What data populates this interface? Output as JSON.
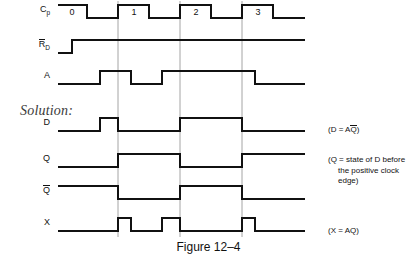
{
  "figure": {
    "caption": "Figure 12–4",
    "solution_label": "Solution:"
  },
  "signals": [
    {
      "name": "Cp",
      "label_main": "C",
      "label_sub": "p",
      "overbar": false,
      "row_y": 18
    },
    {
      "name": "RD",
      "label_main": "R",
      "label_sub": "D",
      "overbar": true,
      "row_y": 53
    },
    {
      "name": "A",
      "label_main": "A",
      "label_sub": "",
      "overbar": false,
      "row_y": 84
    },
    {
      "name": "D",
      "label_main": "D",
      "label_sub": "",
      "overbar": false,
      "row_y": 131
    },
    {
      "name": "Q",
      "label_main": "Q",
      "label_sub": "",
      "overbar": false,
      "row_y": 167
    },
    {
      "name": "Qbar",
      "label_main": "Q",
      "label_sub": "",
      "overbar": true,
      "row_y": 199
    },
    {
      "name": "X",
      "label_main": "X",
      "label_sub": "",
      "overbar": false,
      "row_y": 231
    }
  ],
  "clock_pulse_labels": [
    "0",
    "1",
    "2",
    "3"
  ],
  "annotations": [
    {
      "id": "d-annot",
      "text_pre": "(D = A",
      "overbar_char": "Q",
      "text_post": ")",
      "x": 328,
      "y": 126
    },
    {
      "id": "q-annot-line1",
      "text": "(Q = state of D before",
      "x": 328,
      "y": 158
    },
    {
      "id": "q-annot-line2",
      "text": "the positive clock",
      "x": 328,
      "y": 158
    },
    {
      "id": "q-annot-line3",
      "text": "edge)",
      "x": 328,
      "y": 158
    },
    {
      "id": "x-annot",
      "text": "(X = AQ)",
      "x": 328,
      "y": 227
    }
  ],
  "annotation_text": {
    "d_pre": "(D = A",
    "d_q": "Q",
    "d_post": ")",
    "q_line1": "(Q = state of D before",
    "q_line2": "the positive clock",
    "q_line3": "edge)",
    "x_full": "(X = AQ)"
  },
  "colors": {
    "waveform": "#111111",
    "gridline": "#8d8d8d",
    "text": "#111111",
    "solution_text": "#3a3a3a",
    "background": "#ffffff"
  },
  "chart_data": {
    "type": "line",
    "title": "Figure 12–4",
    "xlabel": "",
    "ylabel": "",
    "grid": true,
    "legend_position": "right",
    "time_axis": {
      "x_start": 58,
      "x_end": 305,
      "units": "pixels",
      "clock_period": 62,
      "clock_high_width": 31
    },
    "gridlines_x": [
      118,
      180,
      242
    ],
    "gridline_note": "positive clock edges of pulses 1, 2, 3",
    "series": [
      {
        "name": "Cp",
        "description": "Clock, 4 positive pulses labelled 0,1,2,3",
        "levels": [
          {
            "x": 58,
            "v": 1
          },
          {
            "x": 87,
            "v": 1
          },
          {
            "x": 87,
            "v": 0
          },
          {
            "x": 118,
            "v": 0
          },
          {
            "x": 118,
            "v": 1
          },
          {
            "x": 149,
            "v": 1
          },
          {
            "x": 149,
            "v": 0
          },
          {
            "x": 180,
            "v": 0
          },
          {
            "x": 180,
            "v": 1
          },
          {
            "x": 211,
            "v": 1
          },
          {
            "x": 211,
            "v": 0
          },
          {
            "x": 242,
            "v": 0
          },
          {
            "x": 242,
            "v": 1
          },
          {
            "x": 273,
            "v": 1
          },
          {
            "x": 273,
            "v": 0
          },
          {
            "x": 305,
            "v": 0
          }
        ],
        "pulse_labels": [
          {
            "label": "0",
            "x": 72
          },
          {
            "label": "1",
            "x": 134
          },
          {
            "label": "2",
            "x": 196
          },
          {
            "label": "3",
            "x": 258
          }
        ]
      },
      {
        "name": "RD",
        "description": "Reset, low at start then high for remainder",
        "levels": [
          {
            "x": 58,
            "v": 0
          },
          {
            "x": 72,
            "v": 0
          },
          {
            "x": 72,
            "v": 1
          },
          {
            "x": 305,
            "v": 1
          }
        ]
      },
      {
        "name": "A",
        "description": "Input A: high during pulse 1 region and across pulses 2-3",
        "levels": [
          {
            "x": 58,
            "v": 0
          },
          {
            "x": 100,
            "v": 0
          },
          {
            "x": 100,
            "v": 1
          },
          {
            "x": 131,
            "v": 1
          },
          {
            "x": 131,
            "v": 0
          },
          {
            "x": 162,
            "v": 0
          },
          {
            "x": 162,
            "v": 1
          },
          {
            "x": 255,
            "v": 1
          },
          {
            "x": 255,
            "v": 0
          },
          {
            "x": 305,
            "v": 0
          }
        ]
      },
      {
        "name": "D",
        "description": "D = A AND Q-bar",
        "levels": [
          {
            "x": 58,
            "v": 0
          },
          {
            "x": 100,
            "v": 0
          },
          {
            "x": 100,
            "v": 1
          },
          {
            "x": 118,
            "v": 1
          },
          {
            "x": 118,
            "v": 0
          },
          {
            "x": 180,
            "v": 0
          },
          {
            "x": 180,
            "v": 1
          },
          {
            "x": 242,
            "v": 1
          },
          {
            "x": 242,
            "v": 0
          },
          {
            "x": 305,
            "v": 0
          }
        ]
      },
      {
        "name": "Q",
        "description": "Q = state of D before the positive clock edge",
        "levels": [
          {
            "x": 58,
            "v": 0
          },
          {
            "x": 118,
            "v": 0
          },
          {
            "x": 118,
            "v": 1
          },
          {
            "x": 180,
            "v": 1
          },
          {
            "x": 180,
            "v": 0
          },
          {
            "x": 242,
            "v": 0
          },
          {
            "x": 242,
            "v": 1
          },
          {
            "x": 305,
            "v": 1
          }
        ]
      },
      {
        "name": "Qbar",
        "description": "Complement of Q",
        "levels": [
          {
            "x": 58,
            "v": 1
          },
          {
            "x": 118,
            "v": 1
          },
          {
            "x": 118,
            "v": 0
          },
          {
            "x": 180,
            "v": 0
          },
          {
            "x": 180,
            "v": 1
          },
          {
            "x": 242,
            "v": 1
          },
          {
            "x": 242,
            "v": 0
          },
          {
            "x": 305,
            "v": 0
          }
        ]
      },
      {
        "name": "X",
        "description": "X = A AND Q, narrow pulses coincident with clock highs 1, 2 and 3",
        "levels": [
          {
            "x": 58,
            "v": 0
          },
          {
            "x": 118,
            "v": 0
          },
          {
            "x": 118,
            "v": 1
          },
          {
            "x": 131,
            "v": 1
          },
          {
            "x": 131,
            "v": 0
          },
          {
            "x": 162,
            "v": 0
          },
          {
            "x": 162,
            "v": 1
          },
          {
            "x": 180,
            "v": 1
          },
          {
            "x": 180,
            "v": 0
          },
          {
            "x": 242,
            "v": 0
          },
          {
            "x": 242,
            "v": 1
          },
          {
            "x": 255,
            "v": 1
          },
          {
            "x": 255,
            "v": 0
          },
          {
            "x": 305,
            "v": 0
          }
        ]
      }
    ]
  }
}
